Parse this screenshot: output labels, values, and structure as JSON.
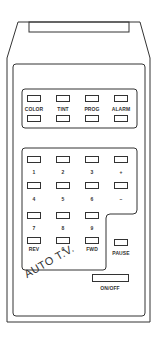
{
  "device": {
    "brand_label": "AUTO T.V.",
    "colors": {
      "line": "#333333",
      "background": "#ffffff"
    }
  },
  "function_group": {
    "buttons": [
      {
        "label": "COLOR"
      },
      {
        "label": "TINT"
      },
      {
        "label": "PROG"
      },
      {
        "label": "ALARM"
      }
    ],
    "second_row_count": 4
  },
  "keypad": {
    "rows": [
      [
        {
          "label": "1"
        },
        {
          "label": "2"
        },
        {
          "label": "3"
        },
        {
          "label": "+"
        }
      ],
      [
        {
          "label": "4"
        },
        {
          "label": "5"
        },
        {
          "label": "6"
        },
        {
          "label": "–"
        }
      ],
      [
        {
          "label": "7"
        },
        {
          "label": "8"
        },
        {
          "label": "9"
        }
      ],
      [
        {
          "label": "REV"
        },
        {
          "label": "0"
        },
        {
          "label": "FWD"
        }
      ]
    ]
  },
  "pause": {
    "label": "PAUSE"
  },
  "power": {
    "label": "ON/OFF"
  }
}
